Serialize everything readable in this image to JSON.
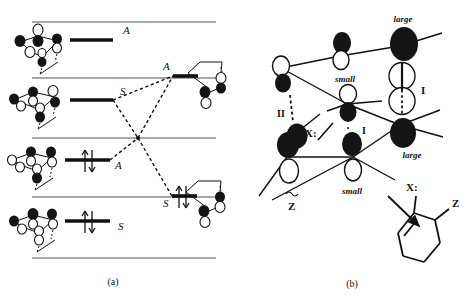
{
  "figure": {
    "panels": [
      {
        "id": "a",
        "caption": "(a)",
        "caption_x": 113,
        "caption_y": 283
      },
      {
        "id": "b",
        "caption": "(b)",
        "caption_x": 352,
        "caption_y": 285
      }
    ]
  },
  "panel_a": {
    "description": "Orbital correlation diagram with five energy levels, reactant orbitals at left, product orbitals at right, and dashed correlation lines that cross.",
    "energy_lines": [
      {
        "name": "level-1",
        "y": 22,
        "x1": 32,
        "x2": 216
      },
      {
        "name": "level-2",
        "y": 78,
        "x1": 32,
        "x2": 216
      },
      {
        "name": "level-3",
        "y": 138,
        "x1": 32,
        "x2": 216
      },
      {
        "name": "level-4",
        "y": 197,
        "x1": 32,
        "x2": 216
      },
      {
        "name": "level-5",
        "y": 258,
        "x1": 32,
        "x2": 216
      }
    ],
    "orbital_bars": [
      {
        "name": "bar-reactant-A-top",
        "symmetry_label": "A",
        "x1": 70,
        "x2": 113,
        "y": 40,
        "label_x": 123,
        "label_y": 33,
        "electrons": "none"
      },
      {
        "name": "bar-reactant-S-upper",
        "symmetry_label": "S",
        "x1": 70,
        "x2": 113,
        "y": 99,
        "label_x": 120,
        "label_y": 93,
        "electrons": "none"
      },
      {
        "name": "bar-reactant-A-lower",
        "symmetry_label": "A",
        "x1": 63,
        "x2": 108,
        "y": 160,
        "label_x": 115,
        "label_y": 168,
        "electrons": "pair"
      },
      {
        "name": "bar-reactant-S-lowest",
        "symmetry_label": "S",
        "x1": 63,
        "x2": 108,
        "y": 221,
        "label_x": 117,
        "label_y": 228,
        "electrons": "pair"
      },
      {
        "name": "bar-product-A-upper",
        "symmetry_label": "A",
        "x1": 150,
        "x2": 193,
        "y": 77,
        "label_x": 143,
        "label_y": 70,
        "electrons": "none"
      },
      {
        "name": "bar-product-S-lower",
        "symmetry_label": "S",
        "x1": 150,
        "x2": 193,
        "y": 196,
        "label_x": 140,
        "label_y": 207,
        "electrons": "pair"
      }
    ],
    "correlation_lines": [
      {
        "name": "correlation-S-to-A",
        "x1": 113,
        "y1": 101,
        "x2": 150,
        "y2": 78,
        "via_x": 138,
        "via_y": 138,
        "style": "dashed"
      },
      {
        "name": "correlation-A-to-S",
        "x1": 110,
        "y1": 159,
        "x2": 150,
        "y2": 196,
        "via_x": 138,
        "via_y": 138,
        "style": "dashed"
      }
    ],
    "symmetry_labels": [
      "A",
      "S",
      "A",
      "S"
    ],
    "crossing_point": {
      "x": 138,
      "y": 138
    }
  },
  "panel_b": {
    "description": "Orbital interaction sketch showing lobes labelled large and small, interaction labels I and II, substituents X: and Z, with an arrow to a cyclohexene product.",
    "labels": [
      {
        "name": "label-large-top",
        "text": "large",
        "x": 403,
        "y": 22,
        "style": "italic"
      },
      {
        "name": "label-small-upper",
        "text": "small",
        "x": 344,
        "y": 82,
        "style": "italic"
      },
      {
        "name": "label-small-lower",
        "text": "small",
        "x": 347,
        "y": 194,
        "style": "italic"
      },
      {
        "name": "label-large-lower",
        "text": "large",
        "x": 400,
        "y": 155,
        "style": "italic"
      },
      {
        "name": "label-interaction-I-right",
        "text": "I",
        "x": 419,
        "y": 104,
        "style": "bold"
      },
      {
        "name": "label-interaction-I-center",
        "text": "I",
        "x": 359,
        "y": 128,
        "style": "bold"
      },
      {
        "name": "label-interaction-II",
        "text": "II",
        "x": 288,
        "y": 116,
        "style": "bold"
      },
      {
        "name": "label-substituent-X",
        "text": "X:",
        "x": 310,
        "y": 132,
        "style": "bold"
      },
      {
        "name": "label-substituent-Z",
        "text": "Z",
        "x": 294,
        "y": 207,
        "style": "bold"
      },
      {
        "name": "label-product-X",
        "text": "X:",
        "x": 411,
        "y": 192,
        "style": "bold"
      },
      {
        "name": "label-product-Z",
        "text": "Z",
        "x": 453,
        "y": 211,
        "style": "bold"
      }
    ],
    "product": {
      "name": "cyclohexene-product",
      "ring_type": "cyclohexene",
      "substituents": [
        "X:",
        "Z"
      ],
      "double_bond": true
    },
    "arrow": {
      "name": "product-arrow",
      "x1": 388,
      "y1": 198,
      "x2": 420,
      "y2": 228
    }
  },
  "colors": {
    "ink": "#111111",
    "energy_line": "#8a8a8a",
    "filled_lobe": "#141414",
    "empty_lobe": "#ffffff",
    "background": "#ffffff"
  }
}
